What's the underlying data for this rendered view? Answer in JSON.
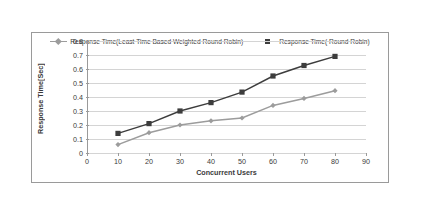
{
  "chart_data": {
    "type": "line",
    "title": "",
    "xlabel": "Concurrent Users",
    "ylabel": "Response Time[Sec]",
    "x": [
      10,
      20,
      30,
      40,
      50,
      60,
      70,
      80
    ],
    "xlim": [
      0,
      90
    ],
    "ylim": [
      0,
      0.8
    ],
    "xticks": [
      "0",
      "10",
      "20",
      "30",
      "40",
      "50",
      "60",
      "70",
      "80",
      "90"
    ],
    "yticks": [
      "0",
      "0.1",
      "0.2",
      "0.3",
      "0.4",
      "0.5",
      "0.6",
      "0.7",
      "0.8"
    ],
    "grid": "horizontal",
    "legend_position": "top-center",
    "series": [
      {
        "name": "Response Time(Least Time Based Weighted Round Robin)",
        "color": "#9c9c9c",
        "marker": "diamond",
        "values": [
          0.06,
          0.145,
          0.2,
          0.23,
          0.25,
          0.34,
          0.39,
          0.445
        ]
      },
      {
        "name": "Response Time( Round Robin)",
        "color": "#3d3d3d",
        "marker": "square",
        "values": [
          0.14,
          0.21,
          0.3,
          0.36,
          0.435,
          0.55,
          0.625,
          0.69
        ]
      }
    ]
  },
  "colors": {
    "series_1": "#9c9c9c",
    "series_2": "#3d3d3d",
    "gridline": "#d4d4d4",
    "axis": "#9a9a9a",
    "border": "#9a9a9a",
    "text": "#3a3a3a",
    "background": "#ffffff"
  }
}
